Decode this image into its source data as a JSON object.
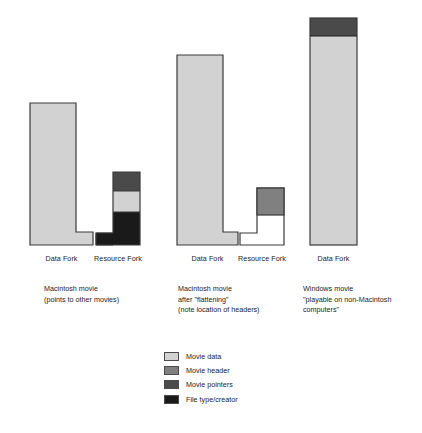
{
  "figure": {
    "type": "diagram",
    "background": "#ffffff"
  },
  "colors": {
    "movie_data": "#d2d2d2",
    "movie_header": "#808080",
    "movie_pointers": "#4a4a4a",
    "file_type_creator": "#1a1a1a",
    "empty_fork": "#ffffff",
    "outline": "#3a3a3a",
    "text": "#1c1c1c"
  },
  "groups": [
    {
      "id": "macintosh-movie",
      "caption_lines": [
        "Macintosh movie",
        "(points to other movies)"
      ],
      "forks": [
        {
          "id": "data-fork-1",
          "label": "Data Fork",
          "shape": "L-right-foot",
          "segments": [
            {
              "name": "Movie data",
              "fill": "movie_data"
            }
          ]
        },
        {
          "id": "resource-fork-1",
          "label": "Resource Fork",
          "shape": "L-left-foot",
          "segments": [
            {
              "name": "Movie pointers",
              "fill": "movie_pointers"
            },
            {
              "name": "Movie data",
              "fill": "movie_data"
            },
            {
              "name": "File type/creator",
              "fill": "file_type_creator"
            }
          ]
        }
      ]
    },
    {
      "id": "macintosh-movie-flattened",
      "caption_lines": [
        "Macintosh movie",
        "after \"flattening\"",
        "(note location of headers)"
      ],
      "forks": [
        {
          "id": "data-fork-2",
          "label": "Data Fork",
          "shape": "L-right-foot",
          "segments": [
            {
              "name": "Movie data",
              "fill": "movie_data"
            }
          ]
        },
        {
          "id": "resource-fork-2",
          "label": "Resource Fork",
          "shape": "L-left-foot",
          "segments": [
            {
              "name": "Movie header",
              "fill": "movie_header"
            },
            {
              "name": "empty",
              "fill": "empty_fork"
            }
          ]
        }
      ]
    },
    {
      "id": "windows-movie",
      "caption_lines": [
        "Windows movie",
        "\"playable on non-Macintosh",
        "computers\""
      ],
      "forks": [
        {
          "id": "data-fork-3",
          "label": "Data Fork",
          "shape": "rectangle",
          "segments": [
            {
              "name": "Movie header",
              "fill": "movie_header"
            },
            {
              "name": "Movie data",
              "fill": "movie_data"
            }
          ]
        }
      ]
    }
  ],
  "legend": {
    "items": [
      {
        "label": "Movie data",
        "color": "#d2d2d2"
      },
      {
        "label": "Movie header",
        "color": "#808080"
      },
      {
        "label": "Movie pointers",
        "color": "#4a4a4a"
      },
      {
        "label": "File type/creator",
        "color": "#1a1a1a"
      }
    ]
  }
}
